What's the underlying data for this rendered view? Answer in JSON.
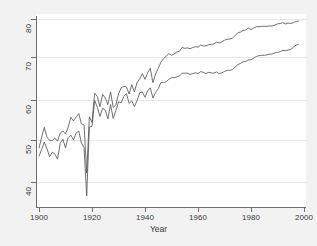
{
  "chart_data": {
    "type": "line",
    "title": "",
    "subtitle": "",
    "xlabel": "Year",
    "ylabel": "",
    "xlim": [
      1900,
      2000
    ],
    "ylim": [
      36,
      81
    ],
    "xticks": [
      1900,
      1920,
      1940,
      1960,
      1980,
      2000
    ],
    "yticks": [
      40,
      50,
      60,
      70,
      80
    ],
    "xtick_labels": [
      "1900",
      "1920",
      "1940",
      "1960",
      "1980",
      "2000"
    ],
    "ytick_labels": [
      "40",
      "50",
      "60",
      "70",
      "80"
    ],
    "grid": "horizontal-only",
    "legend": "none",
    "line_color": "#4d4d4d",
    "plot_background": "#ffffff",
    "page_background": "#f2f2f2",
    "annotations": [
      "Sharp downward spike at 1918 influenza pandemic, both series converge near 37-42",
      "Upper series (female) reaches about 79.5 by 1998",
      "Lower series (male) reaches about 74 by 1998"
    ],
    "x": [
      1900,
      1901,
      1902,
      1903,
      1904,
      1905,
      1906,
      1907,
      1908,
      1909,
      1910,
      1911,
      1912,
      1913,
      1914,
      1915,
      1916,
      1917,
      1918,
      1919,
      1920,
      1921,
      1922,
      1923,
      1924,
      1925,
      1926,
      1927,
      1928,
      1929,
      1930,
      1931,
      1932,
      1933,
      1934,
      1935,
      1936,
      1937,
      1938,
      1939,
      1940,
      1941,
      1942,
      1943,
      1944,
      1945,
      1946,
      1947,
      1948,
      1949,
      1950,
      1951,
      1952,
      1953,
      1954,
      1955,
      1956,
      1957,
      1958,
      1959,
      1960,
      1961,
      1962,
      1963,
      1964,
      1965,
      1966,
      1967,
      1968,
      1969,
      1970,
      1971,
      1972,
      1973,
      1974,
      1975,
      1976,
      1977,
      1978,
      1979,
      1980,
      1981,
      1982,
      1983,
      1984,
      1985,
      1986,
      1987,
      1988,
      1989,
      1990,
      1991,
      1992,
      1993,
      1994,
      1995,
      1996,
      1997,
      1998
    ],
    "series": [
      {
        "name": "Female",
        "values": [
          48.3,
          51.0,
          53.4,
          51.0,
          50.2,
          50.2,
          50.8,
          50.0,
          52.0,
          52.5,
          51.8,
          53.4,
          55.9,
          55.0,
          55.9,
          56.8,
          54.3,
          54.0,
          42.2,
          56.0,
          54.6,
          61.8,
          61.0,
          58.5,
          61.5,
          60.6,
          59.0,
          62.1,
          58.3,
          58.9,
          61.6,
          63.1,
          63.5,
          63.3,
          61.6,
          63.9,
          62.1,
          64.4,
          65.3,
          66.6,
          65.2,
          66.8,
          67.9,
          64.4,
          66.5,
          67.9,
          69.4,
          70.3,
          70.9,
          71.5,
          71.1,
          71.4,
          71.9,
          72.1,
          73.0,
          72.8,
          72.9,
          72.7,
          73.0,
          73.2,
          73.1,
          73.6,
          73.4,
          73.4,
          73.7,
          73.8,
          73.9,
          74.3,
          74.1,
          74.4,
          74.8,
          75.0,
          75.1,
          75.3,
          75.9,
          76.6,
          76.8,
          77.2,
          77.3,
          77.8,
          77.4,
          77.8,
          78.1,
          78.1,
          78.2,
          78.2,
          78.2,
          78.3,
          78.3,
          78.5,
          78.8,
          78.9,
          79.1,
          78.8,
          79.0,
          78.9,
          79.1,
          79.4,
          79.5
        ]
      },
      {
        "name": "Male",
        "values": [
          46.3,
          48.0,
          49.8,
          48.2,
          46.2,
          47.3,
          46.9,
          45.6,
          49.5,
          50.5,
          48.4,
          50.9,
          51.5,
          50.3,
          52.0,
          52.5,
          49.6,
          48.4,
          36.6,
          53.5,
          53.6,
          60.0,
          58.4,
          56.1,
          58.1,
          57.6,
          55.5,
          59.0,
          55.6,
          57.5,
          59.7,
          59.4,
          61.0,
          61.7,
          59.3,
          59.9,
          58.5,
          60.0,
          61.9,
          62.1,
          60.8,
          62.4,
          63.1,
          60.6,
          62.0,
          62.9,
          64.4,
          64.4,
          64.6,
          65.2,
          65.6,
          65.6,
          65.8,
          66.0,
          66.7,
          66.7,
          66.7,
          66.4,
          66.6,
          66.8,
          66.6,
          67.1,
          66.9,
          66.6,
          66.9,
          66.8,
          66.7,
          67.0,
          66.6,
          66.8,
          67.1,
          67.4,
          67.4,
          67.6,
          68.2,
          68.8,
          69.1,
          69.5,
          69.6,
          70.0,
          70.0,
          70.4,
          70.8,
          71.0,
          71.1,
          71.1,
          71.2,
          71.4,
          71.4,
          71.7,
          71.8,
          72.0,
          72.3,
          72.2,
          72.4,
          72.5,
          73.1,
          73.6,
          73.8
        ]
      }
    ]
  }
}
